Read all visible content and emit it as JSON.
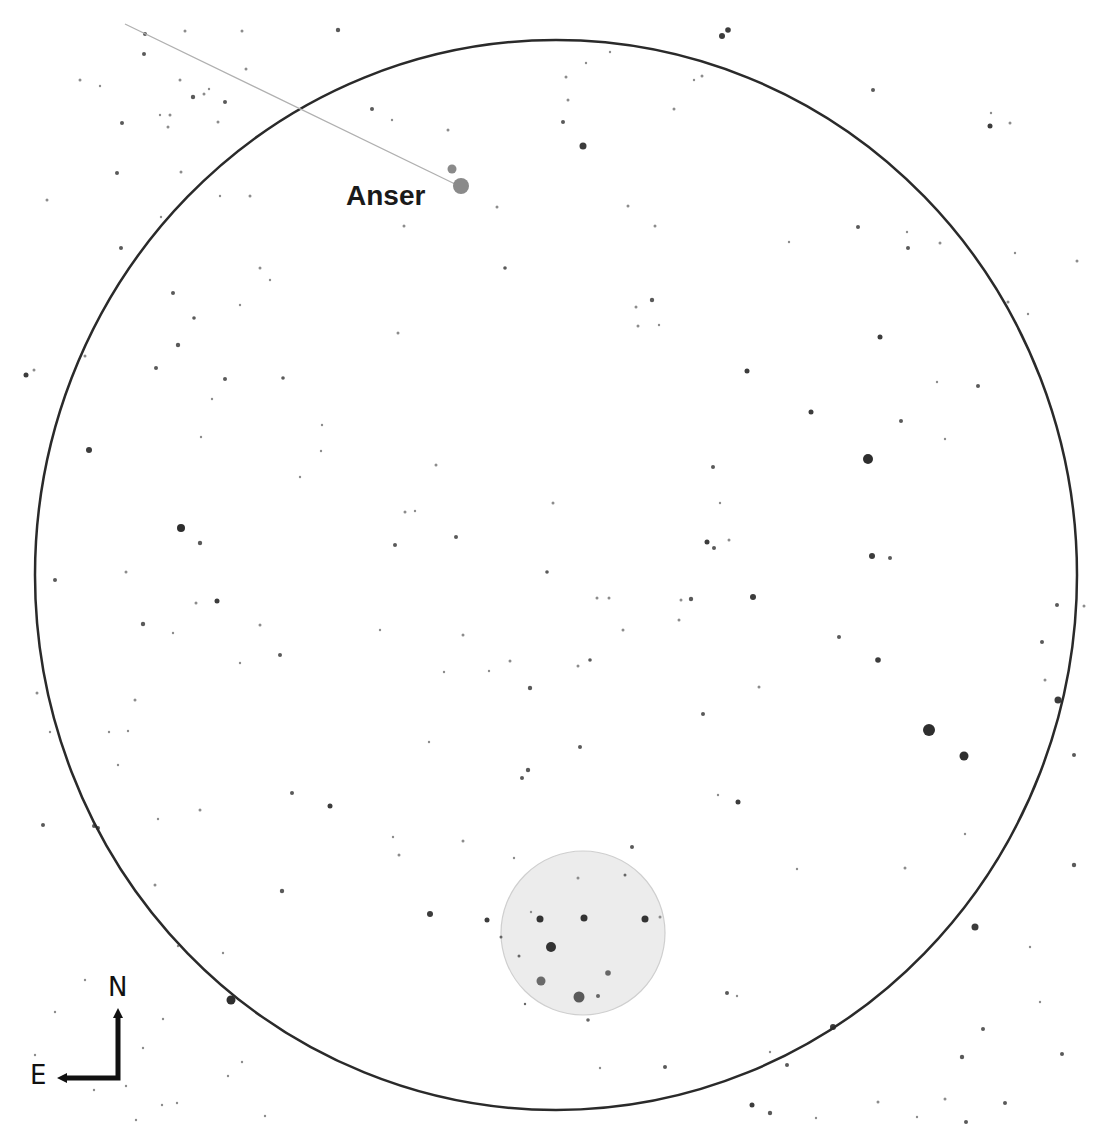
{
  "chart": {
    "type": "finder-chart",
    "background": "#ffffff",
    "field_of_view": {
      "cx": 556,
      "cy": 575,
      "rx": 521,
      "ry": 535,
      "stroke": "#2a2a2a",
      "stroke_width": 2.5
    },
    "object_marker": {
      "cx": 583,
      "cy": 933,
      "r": 82,
      "fill": "#ececec",
      "stroke": "#cfcfcf"
    },
    "pointer_line": {
      "x1": 125,
      "y1": 24,
      "x2": 455,
      "y2": 184,
      "stroke": "#b0b0b0",
      "stroke_width": 1.3
    },
    "labels": [
      {
        "id": "anser",
        "text": "Anser",
        "x": 346,
        "y": 181,
        "size": 28
      }
    ],
    "compass": {
      "north_label": "N",
      "east_label": "E",
      "corner_x": 118,
      "corner_y": 1078,
      "north_tip_y": 1008,
      "east_tip_x": 57,
      "n_x": 108,
      "n_y": 974,
      "e_x": 30,
      "e_y": 1062,
      "color": "#111111"
    },
    "highlighted_stars": [
      {
        "x": 461,
        "y": 186,
        "r": 8,
        "color": "#8a8a8a"
      },
      {
        "x": 452,
        "y": 169,
        "r": 4.5,
        "color": "#8a8a8a"
      }
    ],
    "stars": [
      {
        "x": 583,
        "y": 146,
        "r": 3.5
      },
      {
        "x": 722,
        "y": 36,
        "r": 3
      },
      {
        "x": 728,
        "y": 30,
        "r": 2.8
      },
      {
        "x": 338,
        "y": 30,
        "r": 2.2
      },
      {
        "x": 990,
        "y": 126,
        "r": 2.5
      },
      {
        "x": 873,
        "y": 90,
        "r": 2
      },
      {
        "x": 568,
        "y": 100,
        "r": 1.5
      },
      {
        "x": 563,
        "y": 122,
        "r": 2
      },
      {
        "x": 145,
        "y": 34,
        "r": 2
      },
      {
        "x": 185,
        "y": 31,
        "r": 1.5
      },
      {
        "x": 242,
        "y": 31,
        "r": 1.5
      },
      {
        "x": 144,
        "y": 54,
        "r": 2
      },
      {
        "x": 246,
        "y": 69,
        "r": 1.5
      },
      {
        "x": 80,
        "y": 80,
        "r": 1.5
      },
      {
        "x": 100,
        "y": 86,
        "r": 1.2
      },
      {
        "x": 180,
        "y": 80,
        "r": 1.5
      },
      {
        "x": 193,
        "y": 97,
        "r": 2.2
      },
      {
        "x": 204,
        "y": 94,
        "r": 1.5
      },
      {
        "x": 209,
        "y": 89,
        "r": 1.2
      },
      {
        "x": 225,
        "y": 102,
        "r": 2
      },
      {
        "x": 170,
        "y": 115,
        "r": 1.5
      },
      {
        "x": 122,
        "y": 123,
        "r": 2
      },
      {
        "x": 160,
        "y": 115,
        "r": 1.2
      },
      {
        "x": 168,
        "y": 127,
        "r": 1.5
      },
      {
        "x": 218,
        "y": 122,
        "r": 1.5
      },
      {
        "x": 117,
        "y": 173,
        "r": 2
      },
      {
        "x": 181,
        "y": 172,
        "r": 1.5
      },
      {
        "x": 47,
        "y": 200,
        "r": 1.5
      },
      {
        "x": 250,
        "y": 196,
        "r": 1.5
      },
      {
        "x": 161,
        "y": 217,
        "r": 1.2
      },
      {
        "x": 220,
        "y": 196,
        "r": 1.2
      },
      {
        "x": 121,
        "y": 248,
        "r": 2
      },
      {
        "x": 372,
        "y": 109,
        "r": 2
      },
      {
        "x": 392,
        "y": 120,
        "r": 1.2
      },
      {
        "x": 448,
        "y": 130,
        "r": 1.5
      },
      {
        "x": 497,
        "y": 207,
        "r": 1.5
      },
      {
        "x": 404,
        "y": 226,
        "r": 1.5
      },
      {
        "x": 505,
        "y": 268,
        "r": 1.8
      },
      {
        "x": 260,
        "y": 268,
        "r": 1.5
      },
      {
        "x": 270,
        "y": 280,
        "r": 1.2
      },
      {
        "x": 173,
        "y": 293,
        "r": 2
      },
      {
        "x": 194,
        "y": 318,
        "r": 1.8
      },
      {
        "x": 240,
        "y": 305,
        "r": 1.2
      },
      {
        "x": 178,
        "y": 345,
        "r": 2.2
      },
      {
        "x": 156,
        "y": 368,
        "r": 2
      },
      {
        "x": 225,
        "y": 379,
        "r": 2
      },
      {
        "x": 283,
        "y": 378,
        "r": 1.8
      },
      {
        "x": 398,
        "y": 333,
        "r": 1.5
      },
      {
        "x": 586,
        "y": 63,
        "r": 1.2
      },
      {
        "x": 610,
        "y": 52,
        "r": 1.2
      },
      {
        "x": 694,
        "y": 80,
        "r": 1.2
      },
      {
        "x": 674,
        "y": 109,
        "r": 1.5
      },
      {
        "x": 702,
        "y": 76,
        "r": 1.5
      },
      {
        "x": 566,
        "y": 77,
        "r": 1.5
      },
      {
        "x": 652,
        "y": 300,
        "r": 2.2
      },
      {
        "x": 636,
        "y": 307,
        "r": 1.5
      },
      {
        "x": 659,
        "y": 325,
        "r": 1.2
      },
      {
        "x": 638,
        "y": 326,
        "r": 1.5
      },
      {
        "x": 858,
        "y": 227,
        "r": 2
      },
      {
        "x": 908,
        "y": 248,
        "r": 2
      },
      {
        "x": 907,
        "y": 232,
        "r": 1.2
      },
      {
        "x": 940,
        "y": 243,
        "r": 1.5
      },
      {
        "x": 1010,
        "y": 123,
        "r": 1.5
      },
      {
        "x": 991,
        "y": 113,
        "r": 1.2
      },
      {
        "x": 1015,
        "y": 253,
        "r": 1.2
      },
      {
        "x": 1008,
        "y": 302,
        "r": 1.5
      },
      {
        "x": 1077,
        "y": 261,
        "r": 1.5
      },
      {
        "x": 1028,
        "y": 314,
        "r": 1.2
      },
      {
        "x": 628,
        "y": 206,
        "r": 1.5
      },
      {
        "x": 868,
        "y": 459,
        "r": 5
      },
      {
        "x": 811,
        "y": 412,
        "r": 2.5
      },
      {
        "x": 789,
        "y": 242,
        "r": 1.2
      },
      {
        "x": 655,
        "y": 226,
        "r": 1.5
      },
      {
        "x": 872,
        "y": 556,
        "r": 3
      },
      {
        "x": 890,
        "y": 558,
        "r": 2
      },
      {
        "x": 878,
        "y": 660,
        "r": 2.8
      },
      {
        "x": 753,
        "y": 597,
        "r": 3
      },
      {
        "x": 707,
        "y": 542,
        "r": 2.5
      },
      {
        "x": 714,
        "y": 548,
        "r": 2
      },
      {
        "x": 747,
        "y": 371,
        "r": 2.5
      },
      {
        "x": 713,
        "y": 467,
        "r": 2
      },
      {
        "x": 720,
        "y": 503,
        "r": 1.2
      },
      {
        "x": 729,
        "y": 540,
        "r": 1.5
      },
      {
        "x": 880,
        "y": 337,
        "r": 2.5
      },
      {
        "x": 901,
        "y": 421,
        "r": 2
      },
      {
        "x": 937,
        "y": 382,
        "r": 1.2
      },
      {
        "x": 945,
        "y": 439,
        "r": 1.2
      },
      {
        "x": 978,
        "y": 386,
        "r": 2
      },
      {
        "x": 1058,
        "y": 700,
        "r": 3.5
      },
      {
        "x": 1084,
        "y": 606,
        "r": 1.5
      },
      {
        "x": 1057,
        "y": 605,
        "r": 2
      },
      {
        "x": 1042,
        "y": 642,
        "r": 2
      },
      {
        "x": 1045,
        "y": 680,
        "r": 1.5
      },
      {
        "x": 1074,
        "y": 755,
        "r": 2
      },
      {
        "x": 929,
        "y": 730,
        "r": 6
      },
      {
        "x": 964,
        "y": 756,
        "r": 4.5
      },
      {
        "x": 975,
        "y": 927,
        "r": 3.5
      },
      {
        "x": 905,
        "y": 868,
        "r": 1.5
      },
      {
        "x": 965,
        "y": 834,
        "r": 1.2
      },
      {
        "x": 1074,
        "y": 865,
        "r": 2.2
      },
      {
        "x": 1030,
        "y": 947,
        "r": 1.2
      },
      {
        "x": 1040,
        "y": 1002,
        "r": 1.2
      },
      {
        "x": 1062,
        "y": 1054,
        "r": 2
      },
      {
        "x": 1005,
        "y": 1103,
        "r": 2
      },
      {
        "x": 966,
        "y": 1122,
        "r": 2
      },
      {
        "x": 945,
        "y": 1099,
        "r": 1.5
      },
      {
        "x": 917,
        "y": 1117,
        "r": 1.2
      },
      {
        "x": 983,
        "y": 1029,
        "r": 2
      },
      {
        "x": 962,
        "y": 1057,
        "r": 2.2
      },
      {
        "x": 878,
        "y": 1102,
        "r": 1.5
      },
      {
        "x": 833,
        "y": 1027,
        "r": 3
      },
      {
        "x": 787,
        "y": 1065,
        "r": 2
      },
      {
        "x": 770,
        "y": 1052,
        "r": 1.2
      },
      {
        "x": 752,
        "y": 1105,
        "r": 2.5
      },
      {
        "x": 770,
        "y": 1113,
        "r": 2.2
      },
      {
        "x": 816,
        "y": 1118,
        "r": 1.2
      },
      {
        "x": 665,
        "y": 1067,
        "r": 2
      },
      {
        "x": 738,
        "y": 802,
        "r": 2.5
      },
      {
        "x": 797,
        "y": 869,
        "r": 1.2
      },
      {
        "x": 727,
        "y": 993,
        "r": 2
      },
      {
        "x": 737,
        "y": 996,
        "r": 1.2
      },
      {
        "x": 759,
        "y": 687,
        "r": 1.5
      },
      {
        "x": 718,
        "y": 795,
        "r": 1.2
      },
      {
        "x": 703,
        "y": 714,
        "r": 2
      },
      {
        "x": 691,
        "y": 599,
        "r": 2.2
      },
      {
        "x": 679,
        "y": 620,
        "r": 1.5
      },
      {
        "x": 681,
        "y": 600,
        "r": 1.5
      },
      {
        "x": 839,
        "y": 637,
        "r": 2
      },
      {
        "x": 597,
        "y": 598,
        "r": 1.5
      },
      {
        "x": 609,
        "y": 598,
        "r": 1.5
      },
      {
        "x": 623,
        "y": 630,
        "r": 1.5
      },
      {
        "x": 590,
        "y": 660,
        "r": 1.8
      },
      {
        "x": 578,
        "y": 666,
        "r": 1.5
      },
      {
        "x": 530,
        "y": 688,
        "r": 2.2
      },
      {
        "x": 510,
        "y": 661,
        "r": 1.5
      },
      {
        "x": 553,
        "y": 503,
        "r": 1.5
      },
      {
        "x": 456,
        "y": 537,
        "r": 2
      },
      {
        "x": 547,
        "y": 572,
        "r": 1.8
      },
      {
        "x": 463,
        "y": 635,
        "r": 1.5
      },
      {
        "x": 489,
        "y": 671,
        "r": 1.2
      },
      {
        "x": 580,
        "y": 747,
        "r": 2
      },
      {
        "x": 528,
        "y": 770,
        "r": 2.2
      },
      {
        "x": 522,
        "y": 778,
        "r": 2
      },
      {
        "x": 429,
        "y": 742,
        "r": 1.2
      },
      {
        "x": 514,
        "y": 858,
        "r": 1.2
      },
      {
        "x": 578,
        "y": 878,
        "r": 1.5
      },
      {
        "x": 487,
        "y": 920,
        "r": 2.5
      },
      {
        "x": 430,
        "y": 914,
        "r": 3
      },
      {
        "x": 531,
        "y": 912,
        "r": 1.2
      },
      {
        "x": 463,
        "y": 841,
        "r": 1.5
      },
      {
        "x": 399,
        "y": 855,
        "r": 1.5
      },
      {
        "x": 393,
        "y": 837,
        "r": 1.2
      },
      {
        "x": 330,
        "y": 806,
        "r": 2.5
      },
      {
        "x": 292,
        "y": 793,
        "r": 2
      },
      {
        "x": 282,
        "y": 891,
        "r": 2.2
      },
      {
        "x": 200,
        "y": 810,
        "r": 1.5
      },
      {
        "x": 158,
        "y": 819,
        "r": 1.2
      },
      {
        "x": 155,
        "y": 885,
        "r": 1.5
      },
      {
        "x": 98,
        "y": 828,
        "r": 2
      },
      {
        "x": 94,
        "y": 826,
        "r": 2
      },
      {
        "x": 43,
        "y": 825,
        "r": 2
      },
      {
        "x": 50,
        "y": 732,
        "r": 1.2
      },
      {
        "x": 109,
        "y": 732,
        "r": 1.2
      },
      {
        "x": 135,
        "y": 700,
        "r": 1.5
      },
      {
        "x": 128,
        "y": 731,
        "r": 1.2
      },
      {
        "x": 118,
        "y": 765,
        "r": 1.2
      },
      {
        "x": 181,
        "y": 528,
        "r": 4
      },
      {
        "x": 200,
        "y": 543,
        "r": 2.2
      },
      {
        "x": 217,
        "y": 601,
        "r": 2.5
      },
      {
        "x": 143,
        "y": 624,
        "r": 2.2
      },
      {
        "x": 173,
        "y": 633,
        "r": 1.2
      },
      {
        "x": 126,
        "y": 572,
        "r": 1.5
      },
      {
        "x": 196,
        "y": 603,
        "r": 1.5
      },
      {
        "x": 85,
        "y": 356,
        "r": 1.5
      },
      {
        "x": 89,
        "y": 450,
        "r": 3
      },
      {
        "x": 94,
        "y": 1090,
        "r": 1.2
      },
      {
        "x": 26,
        "y": 375,
        "r": 2.5
      },
      {
        "x": 34,
        "y": 370,
        "r": 1.5
      },
      {
        "x": 55,
        "y": 580,
        "r": 2
      },
      {
        "x": 37,
        "y": 693,
        "r": 1.5
      },
      {
        "x": 260,
        "y": 625,
        "r": 1.5
      },
      {
        "x": 280,
        "y": 655,
        "r": 2
      },
      {
        "x": 240,
        "y": 663,
        "r": 1.2
      },
      {
        "x": 321,
        "y": 451,
        "r": 1.2
      },
      {
        "x": 212,
        "y": 399,
        "r": 1.2
      },
      {
        "x": 201,
        "y": 437,
        "r": 1.2
      },
      {
        "x": 395,
        "y": 545,
        "r": 2
      },
      {
        "x": 405,
        "y": 512,
        "r": 1.5
      },
      {
        "x": 415,
        "y": 511,
        "r": 1.2
      },
      {
        "x": 436,
        "y": 465,
        "r": 1.5
      },
      {
        "x": 380,
        "y": 630,
        "r": 1.2
      },
      {
        "x": 444,
        "y": 672,
        "r": 1.2
      },
      {
        "x": 322,
        "y": 425,
        "r": 1.2
      },
      {
        "x": 300,
        "y": 477,
        "r": 1.2
      },
      {
        "x": 231,
        "y": 1000,
        "r": 4.5
      },
      {
        "x": 163,
        "y": 1019,
        "r": 1.2
      },
      {
        "x": 143,
        "y": 1048,
        "r": 1.2
      },
      {
        "x": 55,
        "y": 1012,
        "r": 1.2
      },
      {
        "x": 35,
        "y": 1055,
        "r": 1.2
      },
      {
        "x": 85,
        "y": 980,
        "r": 1.2
      },
      {
        "x": 126,
        "y": 1086,
        "r": 1.2
      },
      {
        "x": 162,
        "y": 1105,
        "r": 1.2
      },
      {
        "x": 136,
        "y": 1120,
        "r": 1.2
      },
      {
        "x": 177,
        "y": 1103,
        "r": 1.2
      },
      {
        "x": 265,
        "y": 1116,
        "r": 1.2
      },
      {
        "x": 242,
        "y": 1062,
        "r": 1.2
      },
      {
        "x": 228,
        "y": 1076,
        "r": 1.2
      },
      {
        "x": 223,
        "y": 953,
        "r": 1.2
      },
      {
        "x": 178,
        "y": 946,
        "r": 1.2
      },
      {
        "x": 632,
        "y": 847,
        "r": 2
      },
      {
        "x": 660,
        "y": 917,
        "r": 1.5
      },
      {
        "x": 600,
        "y": 1068,
        "r": 1.2
      }
    ],
    "cluster_stars": [
      {
        "x": 540,
        "y": 919,
        "r": 3.5
      },
      {
        "x": 584,
        "y": 918,
        "r": 3.5
      },
      {
        "x": 645,
        "y": 919,
        "r": 3.5
      },
      {
        "x": 551,
        "y": 947,
        "r": 5
      },
      {
        "x": 541,
        "y": 981,
        "r": 4.5,
        "color": "#6a6a6a"
      },
      {
        "x": 608,
        "y": 973,
        "r": 2.8
      },
      {
        "x": 579,
        "y": 997,
        "r": 5.5,
        "color": "#5a5a5a"
      },
      {
        "x": 598,
        "y": 996,
        "r": 2
      },
      {
        "x": 501,
        "y": 937,
        "r": 1.5
      },
      {
        "x": 519,
        "y": 956,
        "r": 1.5
      },
      {
        "x": 525,
        "y": 1004,
        "r": 1.2
      },
      {
        "x": 625,
        "y": 875,
        "r": 1.5
      },
      {
        "x": 588,
        "y": 1020,
        "r": 1.8
      }
    ]
  }
}
